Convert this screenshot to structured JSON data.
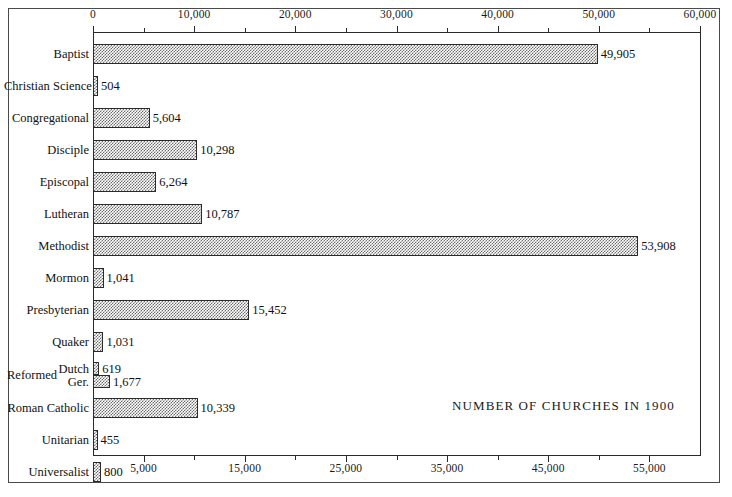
{
  "chart_data": {
    "type": "bar",
    "orientation": "horizontal",
    "title": "NUMBER OF CHURCHES IN 1900",
    "xlabel": "",
    "ylabel": "",
    "xlim": [
      0,
      60000
    ],
    "grid": false,
    "legend": null,
    "categories": [
      "Baptist",
      "Christian Science",
      "Congregational",
      "Disciple",
      "Episcopal",
      "Lutheran",
      "Methodist",
      "Mormon",
      "Presbyterian",
      "Quaker",
      "Dutch",
      "Ger.",
      "Roman Catholic",
      "Unitarian",
      "Universalist"
    ],
    "values": [
      49905,
      504,
      5604,
      10298,
      6264,
      10787,
      53908,
      1041,
      15452,
      1031,
      619,
      1677,
      10339,
      455,
      800
    ],
    "value_labels": [
      "49,905",
      "504",
      "5,604",
      "10,298",
      "6,264",
      "10,787",
      "53,908",
      "1,041",
      "15,452",
      "1,031",
      "619",
      "1,677",
      "10,339",
      "455",
      "800"
    ],
    "group_label": "Reformed",
    "group_members": [
      "Dutch",
      "Ger."
    ],
    "top_axis_ticks": [
      0,
      10000,
      20000,
      30000,
      40000,
      50000,
      60000
    ],
    "top_axis_tick_labels": [
      "0",
      "10,000",
      "20,000",
      "30,000",
      "40,000",
      "50,000",
      "60,000"
    ],
    "top_axis_minor_ticks": [
      5000,
      15000,
      25000,
      35000,
      45000,
      55000
    ],
    "bottom_axis_ticks": [
      5000,
      15000,
      25000,
      35000,
      45000,
      55000
    ],
    "bottom_axis_tick_labels": [
      "5,000",
      "15,000",
      "25,000",
      "35,000",
      "45,000",
      "55,000"
    ],
    "bottom_axis_minor_ticks": [
      10000,
      20000,
      30000,
      40000,
      50000
    ],
    "bar_fill_color": "#6e6e6e",
    "bar_border_color": "#2b2b2b",
    "axis_color": "#2a2a2a",
    "background_color": "#ffffff"
  }
}
